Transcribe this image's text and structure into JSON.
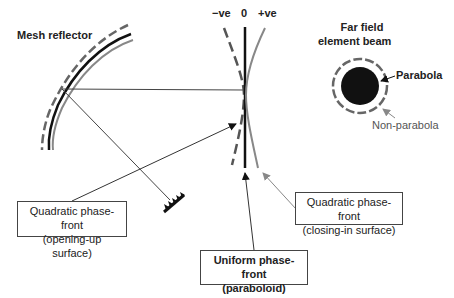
{
  "labels": {
    "mesh_reflector": "Mesh reflector",
    "neg_ve": "−ve",
    "zero": "0",
    "pos_ve": "+ve",
    "far_field_line1": "Far field",
    "far_field_line2": "element beam",
    "parabola": "Parabola",
    "non_parabola": "Non-parabola"
  },
  "boxes": {
    "opening_up": {
      "line1": "Quadratic phase-front",
      "line2": "(opening-up surface)"
    },
    "closing_in": {
      "line1": "Quadratic phase-front",
      "line2": "(closing-in surface)"
    },
    "uniform": {
      "line1": "Uniform phase-front",
      "line2": "(paraboloid)"
    }
  },
  "colors": {
    "black": "#111111",
    "gray": "#808080",
    "dark_gray": "#555555"
  }
}
